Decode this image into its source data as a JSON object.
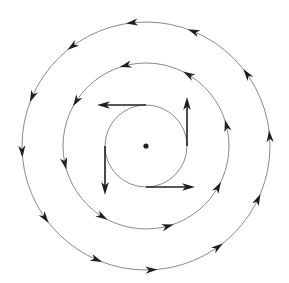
{
  "diagram": {
    "type": "concentric-circulation-field",
    "center": {
      "x": 146,
      "y": 146,
      "dot_radius": 2.6
    },
    "colors": {
      "circle_stroke": "#8a8a8a",
      "arrow": "#1f1f1f",
      "background": "#ffffff"
    },
    "rotation": "counterclockwise",
    "circles": [
      {
        "name": "outer-circle",
        "radius": 124,
        "arrow_angles_deg": [
          5,
          36,
          68,
          97,
          127,
          157,
          183,
          216,
          247,
          273,
          306,
          335
        ]
      },
      {
        "name": "middle-circle",
        "radius": 83,
        "arrow_angles_deg": [
          15,
          60,
          105,
          148,
          193,
          239,
          286,
          331
        ]
      },
      {
        "name": "inner-circle",
        "radius": 41,
        "arrow_angles_deg": []
      }
    ],
    "tangent_vectors": [
      {
        "name": "top-vector",
        "angle_deg": 90,
        "length": 49
      },
      {
        "name": "left-vector",
        "angle_deg": 180,
        "length": 49
      },
      {
        "name": "bottom-vector",
        "angle_deg": 270,
        "length": 49
      },
      {
        "name": "right-vector",
        "angle_deg": 0,
        "length": 49
      }
    ]
  }
}
